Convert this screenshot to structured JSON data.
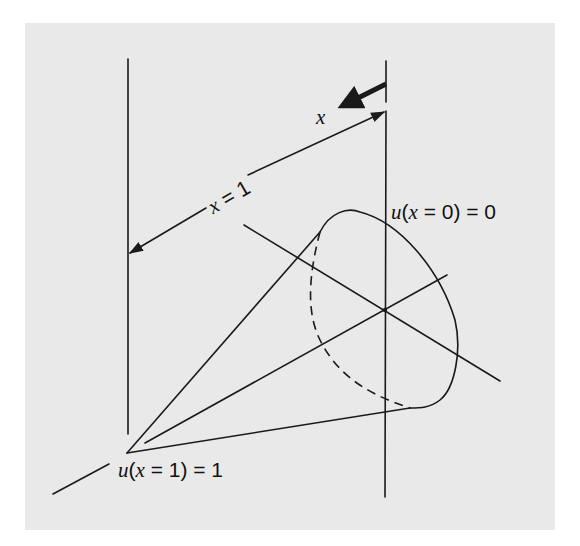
{
  "figure": {
    "background_color": "#e9e9e9",
    "line_color": "#1a1a1a",
    "labels": {
      "direction_var": "x",
      "length_label": {
        "var": "x",
        "eq": " = 1"
      },
      "bc_right": {
        "fn": "u",
        "arg_var": "x",
        "rest": " = 0) = 0"
      },
      "bc_left": {
        "fn": "u",
        "arg_var": "x",
        "rest": " = 1) = 1"
      }
    },
    "elements": [
      "left-vertical-line",
      "right-vertical-line",
      "direction-arrow",
      "length-dimension-arrow",
      "ellipse-cross-section",
      "cone-generators",
      "cross-section-axes"
    ]
  }
}
